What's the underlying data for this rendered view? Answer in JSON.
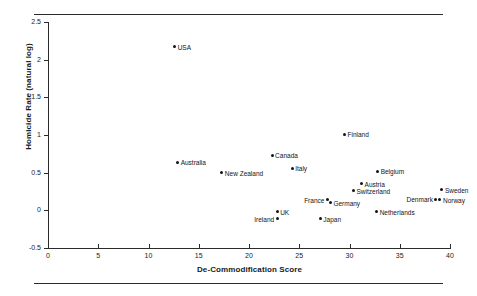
{
  "figure": {
    "top_rule": "",
    "bottom_rule": ""
  },
  "chart_data": {
    "type": "scatter",
    "title": "",
    "xlabel": "De-Commodification Score",
    "ylabel": "Homicide Rate (natural log)",
    "xlim": [
      0,
      40
    ],
    "ylim": [
      -0.5,
      2.5
    ],
    "xticks": [
      0,
      5,
      10,
      15,
      20,
      25,
      30,
      35,
      40
    ],
    "xtick_labels": [
      "0",
      "5",
      "10",
      "15",
      "20",
      "25",
      "30",
      "35",
      "40"
    ],
    "yticks": [
      -0.5,
      0,
      0.5,
      1,
      1.5,
      2,
      2.5
    ],
    "ytick_labels": [
      "-0.5",
      "0",
      "0.5",
      "1",
      "1.5",
      "2",
      "2.5"
    ],
    "grid": false,
    "legend": null,
    "marker_color": "#141414",
    "points": [
      {
        "label": "USA",
        "x": 12.6,
        "y": 2.17,
        "label_pos": "right"
      },
      {
        "label": "Australia",
        "x": 12.9,
        "y": 0.64,
        "label_pos": "right"
      },
      {
        "label": "New Zealand",
        "x": 17.3,
        "y": 0.5,
        "label_pos": "right"
      },
      {
        "label": "Canada",
        "x": 22.3,
        "y": 0.73,
        "label_pos": "right"
      },
      {
        "label": "Italy",
        "x": 24.3,
        "y": 0.56,
        "label_pos": "right"
      },
      {
        "label": "Finland",
        "x": 29.5,
        "y": 1.01,
        "label_pos": "right"
      },
      {
        "label": "Belgium",
        "x": 32.8,
        "y": 0.52,
        "label_pos": "right"
      },
      {
        "label": "Austria",
        "x": 31.2,
        "y": 0.35,
        "label_pos": "right"
      },
      {
        "label": "Switzerland",
        "x": 30.4,
        "y": 0.26,
        "label_pos": "right"
      },
      {
        "label": "France",
        "x": 27.8,
        "y": 0.14,
        "label_pos": "left"
      },
      {
        "label": "Germany",
        "x": 28.1,
        "y": 0.1,
        "label_pos": "right"
      },
      {
        "label": "Sweden",
        "x": 39.2,
        "y": 0.27,
        "label_pos": "right"
      },
      {
        "label": "Denmark",
        "x": 38.6,
        "y": 0.15,
        "label_pos": "left"
      },
      {
        "label": "Norway",
        "x": 39.0,
        "y": 0.14,
        "label_pos": "right"
      },
      {
        "label": "UK",
        "x": 22.8,
        "y": -0.02,
        "label_pos": "right"
      },
      {
        "label": "Ireland",
        "x": 22.8,
        "y": -0.11,
        "label_pos": "left"
      },
      {
        "label": "Japan",
        "x": 27.1,
        "y": -0.11,
        "label_pos": "right"
      },
      {
        "label": "Netherlands",
        "x": 32.7,
        "y": -0.02,
        "label_pos": "right"
      }
    ]
  }
}
